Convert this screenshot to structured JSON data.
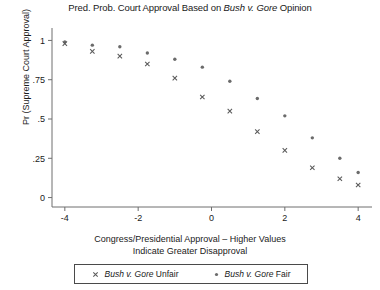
{
  "chart_data": {
    "type": "scatter",
    "title": "Pred. Prob. Court Approval Based on Bush v. Gore Opinion",
    "title_plain": "Pred. Prob. Court Approval Based on ",
    "title_italic": "Bush v. Gore",
    "title_tail": " Opinion",
    "xlabel_line1": "Congress/Presidential Approval – Higher Values",
    "xlabel_line2": "Indicate Greater Disapproval",
    "ylabel": "Pr (Supreme Court Approval)",
    "xlim": [
      -4.35,
      4.35
    ],
    "ylim": [
      -0.06,
      1.06
    ],
    "xticks": [
      -4,
      -2,
      0,
      2,
      4
    ],
    "xticklabels": [
      "-4",
      "-2",
      "0",
      "2",
      "4"
    ],
    "yticks": [
      0,
      0.25,
      0.5,
      0.75,
      1
    ],
    "yticklabels": [
      "0",
      ".25",
      ".5",
      ".75",
      "1"
    ],
    "grid": false,
    "legend_position": "below-axes",
    "series": [
      {
        "name": "Bush v. Gore Fair",
        "marker": "dot",
        "color": "#6b6b6b",
        "x": [
          -4.0,
          -3.25,
          -2.5,
          -1.75,
          -1.0,
          -0.25,
          0.5,
          1.25,
          2.0,
          2.75,
          3.5,
          4.0
        ],
        "y": [
          0.99,
          0.97,
          0.96,
          0.92,
          0.88,
          0.83,
          0.74,
          0.63,
          0.52,
          0.38,
          0.25,
          0.16
        ]
      },
      {
        "name": "Bush v. Gore Unfair",
        "marker": "x",
        "color": "#5a5a5a",
        "x": [
          -4.0,
          -3.25,
          -2.5,
          -1.75,
          -1.0,
          -0.25,
          0.5,
          1.25,
          2.0,
          2.75,
          3.5,
          4.0
        ],
        "y": [
          0.98,
          0.93,
          0.9,
          0.85,
          0.76,
          0.64,
          0.55,
          0.42,
          0.3,
          0.19,
          0.12,
          0.08
        ]
      }
    ]
  },
  "legend": {
    "items": [
      {
        "marker": "x",
        "plain": "",
        "italic": "Bush v. Gore",
        "tail": " Unfair"
      },
      {
        "marker": "dot",
        "plain": "",
        "italic": "Bush v. Gore",
        "tail": " Fair"
      }
    ]
  }
}
